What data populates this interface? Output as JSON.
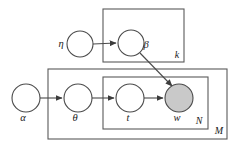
{
  "diagram": {
    "kind": "plate-notation-graphical-model",
    "background_color": "#ffffff",
    "stroke_color": "#4a4a4a",
    "observed_fill_color": "#c9c9c9",
    "unobserved_fill_color": "#ffffff",
    "nodes": [
      {
        "id": "eta",
        "label": "η",
        "cx": 80,
        "cy": 44,
        "r": 13,
        "observed": false,
        "label_x": 61,
        "label_y": 47
      },
      {
        "id": "beta",
        "label": "β",
        "cx": 131,
        "cy": 43,
        "r": 13,
        "observed": false,
        "label_x": 146,
        "label_y": 48
      },
      {
        "id": "alpha",
        "label": "α",
        "cx": 26,
        "cy": 98,
        "r": 14,
        "observed": false,
        "label_x": 23,
        "label_y": 121
      },
      {
        "id": "theta",
        "label": "θ",
        "cx": 78,
        "cy": 98,
        "r": 14,
        "observed": false,
        "label_x": 75,
        "label_y": 121
      },
      {
        "id": "t",
        "label": "t",
        "cx": 130,
        "cy": 98,
        "r": 14,
        "observed": false,
        "label_x": 128,
        "label_y": 121
      },
      {
        "id": "w",
        "label": "w",
        "cx": 179,
        "cy": 98,
        "r": 14,
        "observed": true,
        "label_x": 175,
        "label_y": 121
      }
    ],
    "plates": [
      {
        "id": "plate-k",
        "label": "k",
        "x": 103,
        "y": 9,
        "width": 81,
        "height": 53,
        "label_x": 177,
        "label_y": 58
      },
      {
        "id": "plate-m",
        "label": "M",
        "x": 48,
        "y": 69,
        "width": 179,
        "height": 70,
        "label_x": 218,
        "label_y": 134
      },
      {
        "id": "plate-n",
        "label": "N",
        "x": 103,
        "y": 77,
        "width": 105,
        "height": 52,
        "label_x": 198,
        "label_y": 124
      }
    ],
    "edges": [
      {
        "id": "edge-eta-beta",
        "from": "eta",
        "to": "beta",
        "x1": 93,
        "y1": 44,
        "x2": 116,
        "y2": 43
      },
      {
        "id": "edge-alpha-theta",
        "from": "alpha",
        "to": "theta",
        "x1": 40,
        "y1": 98,
        "x2": 62,
        "y2": 98
      },
      {
        "id": "edge-theta-t",
        "from": "theta",
        "to": "t",
        "x1": 92,
        "y1": 98,
        "x2": 114,
        "y2": 98
      },
      {
        "id": "edge-t-w",
        "from": "t",
        "to": "w",
        "x1": 144,
        "y1": 98,
        "x2": 163,
        "y2": 98
      },
      {
        "id": "edge-beta-w",
        "from": "beta",
        "to": "w",
        "x1": 140,
        "y1": 53,
        "x2": 172,
        "y2": 86
      }
    ]
  }
}
